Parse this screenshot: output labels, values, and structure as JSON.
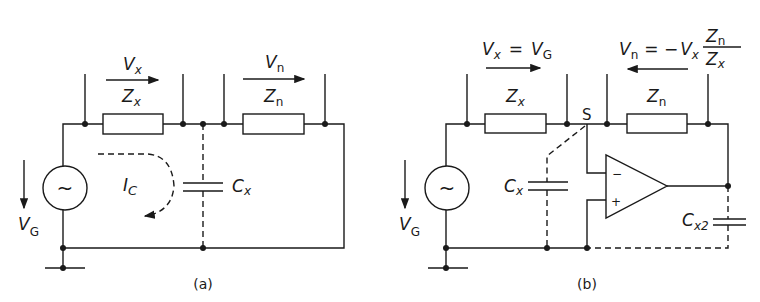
{
  "figure": {
    "panel_a": {
      "caption": "(a)",
      "labels": {
        "vx_main": "V",
        "vx_sub": "x",
        "vn_main": "V",
        "vn_sub": "n",
        "zx_main": "Z",
        "zx_sub": "x",
        "zn_main": "Z",
        "zn_sub": "n",
        "vg_main": "V",
        "vg_sub": "G",
        "ic_main": "I",
        "ic_sub": "C",
        "cx_main": "C",
        "cx_sub": "x",
        "source_symbol": "~"
      }
    },
    "panel_b": {
      "caption": "(b)",
      "labels": {
        "vx_eq_main1": "V",
        "vx_eq_sub1": "x",
        "vx_eq_op": "=",
        "vx_eq_main2": "V",
        "vx_eq_sub2": "G",
        "vn_eq_main1": "V",
        "vn_eq_sub1": "n",
        "vn_eq_op": "= −",
        "vn_eq_main2": "V",
        "vn_eq_sub2": "x",
        "frac_num_main": "Z",
        "frac_num_sub": "n",
        "frac_den_main": "Z",
        "frac_den_sub": "x",
        "zx_main": "Z",
        "zx_sub": "x",
        "zn_main": "Z",
        "zn_sub": "n",
        "node_s": "S",
        "vg_main": "V",
        "vg_sub": "G",
        "cx_main": "C",
        "cx_sub": "x",
        "cx2_main": "C",
        "cx2_sub": "x2",
        "opamp_minus": "−",
        "opamp_plus": "+",
        "source_symbol": "~"
      }
    }
  }
}
